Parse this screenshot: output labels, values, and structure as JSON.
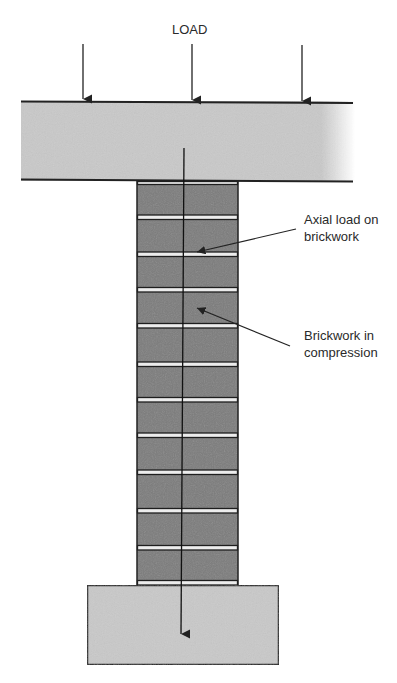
{
  "diagram": {
    "title_label": "LOAD",
    "callouts": [
      {
        "line1": "Axial load on",
        "line2": "brickwork"
      },
      {
        "line1": "Brickwork in",
        "line2": "compression"
      }
    ],
    "components": {
      "top_beam": "concrete beam / slab carrying load",
      "column": "brickwork pier with 12 courses and mortar joints",
      "base": "concrete foundation"
    },
    "colors": {
      "beam_fill": "#c8c8c8",
      "brick_fill": "#7c7c7c",
      "mortar_fill": "#ececec",
      "line": "#222222"
    }
  }
}
